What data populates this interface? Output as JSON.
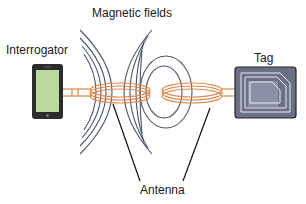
{
  "diagram": {
    "type": "rfid-inductive-coupling",
    "labels": {
      "magnetic_fields": "Magnetic fields",
      "interrogator": "Interrogator",
      "tag": "Tag",
      "antenna": "Antenna"
    },
    "colors": {
      "coil": "#e08a4e",
      "field_lines": "#4a5568",
      "device_frame": "#2b2b2b",
      "device_screen": "#bcd9a0",
      "tag_body": "#6b7087",
      "tag_inner": "#8a90a6",
      "tag_trace": "#e8eaf2",
      "pointer": "#111111"
    },
    "components": [
      {
        "id": "interrogator",
        "kind": "reader-device"
      },
      {
        "id": "reader-antenna",
        "kind": "coil"
      },
      {
        "id": "tag-antenna",
        "kind": "coil"
      },
      {
        "id": "tag",
        "kind": "rfid-chip"
      }
    ]
  }
}
